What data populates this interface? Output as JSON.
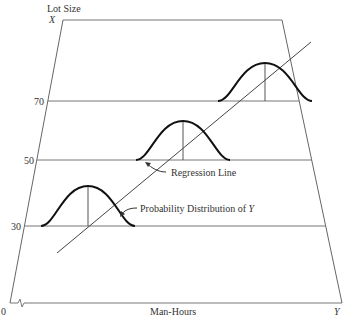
{
  "diagram": {
    "y_axis_title": "Lot Size",
    "y_axis_symbol": "X",
    "x_axis_title": "Man-Hours",
    "x_axis_symbol": "Y",
    "origin_label": "0",
    "levels": [
      {
        "label": "70",
        "value": 70
      },
      {
        "label": "50",
        "value": 50
      },
      {
        "label": "30",
        "value": 30
      }
    ],
    "annotations": {
      "regression_line": "Regression Line",
      "probability_distribution": "Probability Distribution of ",
      "probability_distribution_var": "Y"
    },
    "colors": {
      "line": "#555555",
      "curve": "#111111",
      "background": "#ffffff"
    }
  }
}
